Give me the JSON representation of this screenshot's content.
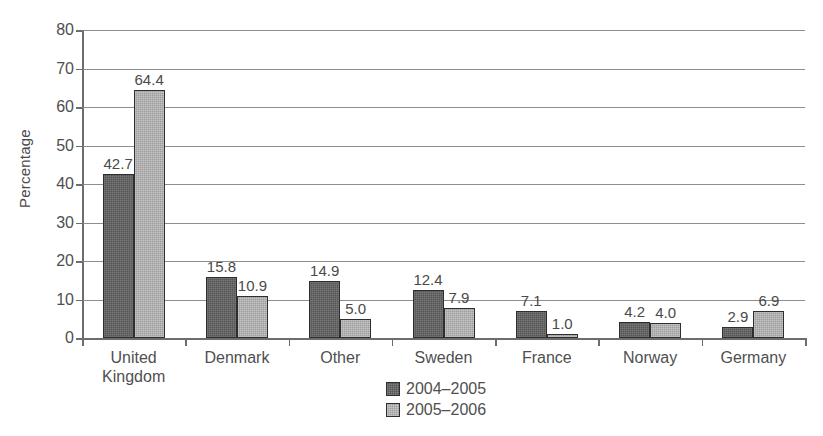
{
  "chart_data": {
    "type": "bar",
    "title": "",
    "xlabel": "",
    "ylabel": "Percentage",
    "ylim": [
      0,
      80
    ],
    "yticks": [
      0,
      10,
      20,
      30,
      40,
      50,
      60,
      70,
      80
    ],
    "ytick_labels": [
      "0",
      "10",
      "20",
      "30",
      "40",
      "50",
      "60",
      "70",
      "80"
    ],
    "grid": true,
    "legend_position": "bottom-center",
    "categories": [
      "United Kingdom",
      "Denmark",
      "Other",
      "Sweden",
      "France",
      "Norway",
      "Germany"
    ],
    "category_labels": [
      "United\nKingdom",
      "Denmark",
      "Other",
      "Sweden",
      "France",
      "Norway",
      "Germany"
    ],
    "series": [
      {
        "name": "2004–2005",
        "color": "#565656",
        "values": [
          42.7,
          15.8,
          14.9,
          12.4,
          7.1,
          4.2,
          2.9
        ],
        "value_labels": [
          "42.7",
          "15.8",
          "14.9",
          "12.4",
          "7.1",
          "4.2",
          "2.9"
        ]
      },
      {
        "name": "2005–2006",
        "color": "#9d9d9d",
        "values": [
          64.4,
          10.9,
          5.0,
          7.9,
          1.0,
          4.0,
          6.9
        ],
        "value_labels": [
          "64.4",
          "10.9",
          "5.0",
          "7.9",
          "1.0",
          "4.0",
          "6.9"
        ]
      }
    ]
  },
  "legend": {
    "entries": [
      {
        "label": "2004–2005"
      },
      {
        "label": "2005–2006"
      }
    ]
  }
}
